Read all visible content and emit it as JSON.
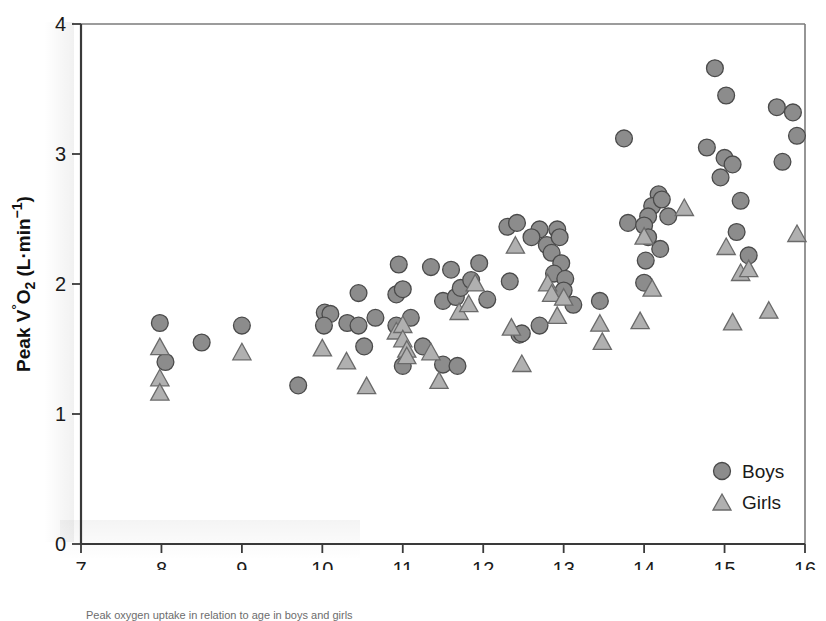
{
  "chart_data": {
    "type": "scatter",
    "title": "",
    "xlabel": "Age (years)",
    "ylabel": "Peak V̊O₂ (L·min⁻¹)",
    "ylabel_parts": {
      "lead": "Peak ",
      "v": "V",
      "dot": "°",
      "sub": "O",
      "subscript": "2",
      "units_open": " (L·min",
      "units_exp": "−1",
      "units_close": ")"
    },
    "xlim": [
      7,
      16
    ],
    "ylim": [
      0,
      4
    ],
    "xticks": [
      "7",
      "8",
      "9",
      "10",
      "11",
      "12",
      "13",
      "14",
      "15",
      "16"
    ],
    "yticks": [
      "0",
      "1",
      "2",
      "3",
      "4"
    ],
    "grid": false,
    "legend_position": "bottom-right",
    "legend": [
      {
        "name": "Boys",
        "marker": "circle",
        "color": "#8c8c8c"
      },
      {
        "name": "Girls",
        "marker": "triangle",
        "color": "#b0b0b0"
      }
    ],
    "series": [
      {
        "name": "Boys",
        "marker": "circle",
        "points": [
          [
            7.98,
            1.7
          ],
          [
            8.05,
            1.4
          ],
          [
            8.5,
            1.55
          ],
          [
            9.0,
            1.68
          ],
          [
            9.7,
            1.22
          ],
          [
            10.03,
            1.78
          ],
          [
            10.1,
            1.77
          ],
          [
            10.02,
            1.68
          ],
          [
            10.31,
            1.7
          ],
          [
            10.45,
            1.93
          ],
          [
            10.45,
            1.68
          ],
          [
            10.52,
            1.52
          ],
          [
            10.66,
            1.74
          ],
          [
            10.92,
            1.92
          ],
          [
            10.92,
            1.68
          ],
          [
            10.95,
            2.15
          ],
          [
            11.0,
            1.96
          ],
          [
            11.1,
            1.74
          ],
          [
            11.0,
            1.37
          ],
          [
            11.25,
            1.52
          ],
          [
            11.35,
            2.13
          ],
          [
            11.5,
            1.87
          ],
          [
            11.5,
            1.38
          ],
          [
            11.6,
            2.11
          ],
          [
            11.66,
            1.9
          ],
          [
            11.72,
            1.97
          ],
          [
            11.85,
            2.03
          ],
          [
            11.95,
            2.16
          ],
          [
            12.05,
            1.88
          ],
          [
            12.3,
            2.44
          ],
          [
            12.42,
            2.47
          ],
          [
            12.33,
            2.02
          ],
          [
            12.45,
            1.61
          ],
          [
            12.7,
            2.42
          ],
          [
            12.6,
            2.36
          ],
          [
            12.79,
            2.3
          ],
          [
            12.92,
            2.42
          ],
          [
            12.95,
            2.36
          ],
          [
            12.85,
            2.24
          ],
          [
            12.97,
            2.16
          ],
          [
            12.88,
            2.08
          ],
          [
            13.02,
            2.04
          ],
          [
            13.0,
            1.95
          ],
          [
            13.12,
            1.84
          ],
          [
            12.7,
            1.68
          ],
          [
            12.48,
            1.62
          ],
          [
            13.75,
            3.12
          ],
          [
            13.8,
            2.47
          ],
          [
            14.18,
            2.69
          ],
          [
            14.1,
            2.6
          ],
          [
            14.22,
            2.65
          ],
          [
            14.05,
            2.52
          ],
          [
            14.3,
            2.52
          ],
          [
            14.0,
            2.45
          ],
          [
            14.05,
            2.36
          ],
          [
            14.2,
            2.27
          ],
          [
            14.02,
            2.18
          ],
          [
            14.78,
            3.05
          ],
          [
            14.88,
            3.66
          ],
          [
            15.0,
            2.97
          ],
          [
            15.02,
            3.45
          ],
          [
            14.95,
            2.82
          ],
          [
            15.1,
            2.92
          ],
          [
            15.2,
            2.64
          ],
          [
            15.15,
            2.4
          ],
          [
            15.3,
            2.22
          ],
          [
            14.0,
            2.01
          ],
          [
            15.65,
            3.36
          ],
          [
            15.85,
            3.32
          ],
          [
            15.9,
            3.14
          ],
          [
            15.72,
            2.94
          ],
          [
            13.45,
            1.87
          ],
          [
            11.68,
            1.37
          ]
        ]
      },
      {
        "name": "Girls",
        "marker": "triangle",
        "points": [
          [
            7.98,
            1.51
          ],
          [
            7.98,
            1.27
          ],
          [
            7.98,
            1.16
          ],
          [
            9.0,
            1.47
          ],
          [
            10.0,
            1.5
          ],
          [
            10.3,
            1.4
          ],
          [
            10.55,
            1.21
          ],
          [
            10.92,
            1.63
          ],
          [
            11.0,
            1.68
          ],
          [
            11.0,
            1.57
          ],
          [
            11.05,
            1.49
          ],
          [
            11.05,
            1.44
          ],
          [
            11.35,
            1.47
          ],
          [
            11.45,
            1.25
          ],
          [
            11.7,
            1.78
          ],
          [
            11.82,
            1.84
          ],
          [
            11.9,
            2.0
          ],
          [
            12.4,
            2.29
          ],
          [
            12.48,
            1.38
          ],
          [
            12.8,
            2.0
          ],
          [
            12.85,
            1.92
          ],
          [
            12.92,
            1.75
          ],
          [
            13.0,
            1.89
          ],
          [
            13.48,
            1.55
          ],
          [
            13.95,
            1.71
          ],
          [
            14.0,
            2.36
          ],
          [
            14.5,
            2.58
          ],
          [
            14.1,
            1.96
          ],
          [
            15.02,
            2.28
          ],
          [
            15.2,
            2.08
          ],
          [
            15.3,
            2.11
          ],
          [
            15.1,
            1.7
          ],
          [
            15.55,
            1.79
          ],
          [
            15.9,
            2.38
          ],
          [
            13.45,
            1.69
          ],
          [
            12.35,
            1.66
          ]
        ]
      }
    ]
  },
  "caption": "Peak oxygen uptake in relation to age in boys and girls"
}
